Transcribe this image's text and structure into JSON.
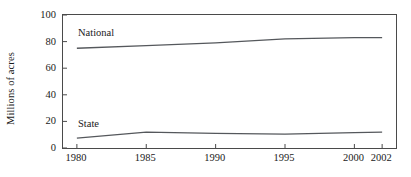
{
  "chart_data": {
    "type": "line",
    "title": "",
    "xlabel": "",
    "ylabel": "Millions of acres",
    "xlim": [
      1979,
      2003
    ],
    "ylim": [
      0,
      100
    ],
    "grid": false,
    "legend_position": "inline-annotation",
    "x_tick_labels": [
      "1980",
      "1985",
      "1990",
      "1995",
      "2000",
      "2002"
    ],
    "x_tick_values": [
      1980,
      1985,
      1990,
      1995,
      2000,
      2002
    ],
    "y_tick_labels": [
      "0",
      "20",
      "40",
      "60",
      "80",
      "100"
    ],
    "y_tick_values": [
      0,
      20,
      40,
      60,
      80,
      100
    ],
    "x": [
      1980,
      1985,
      1990,
      1995,
      2000,
      2002
    ],
    "series": [
      {
        "name": "National",
        "label": "National",
        "color": "#55585c",
        "values": [
          75,
          77,
          79,
          82,
          83,
          83
        ]
      },
      {
        "name": "State",
        "label": "State",
        "color": "#55585c",
        "values": [
          7.5,
          12,
          11,
          10.5,
          11.5,
          12
        ]
      }
    ],
    "annotations": [
      {
        "text": "National",
        "x": 1980.8,
        "y": 91
      },
      {
        "text": "State",
        "x": 1980.8,
        "y": 24
      }
    ]
  },
  "style": {
    "axis_color": "#4a4a4a",
    "line_color": "#55585c",
    "text_color": "#1a1a1a",
    "background": "#ffffff"
  }
}
